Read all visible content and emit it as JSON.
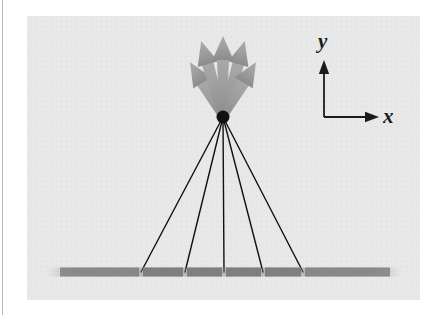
{
  "figure": {
    "kind": "physics-diagram",
    "panel": {
      "background_color": "#e8e8e8",
      "left": 27,
      "top": 16,
      "width": 393,
      "height": 284
    },
    "page_background_color": "#ffffff",
    "left_rule_color": "#b9b9b9"
  },
  "axes": {
    "x_label": "x",
    "y_label": "y",
    "color": "#1a1a1a",
    "origin": {
      "x": 324,
      "y": 117
    },
    "x_tip": {
      "x": 378,
      "y": 117
    },
    "y_tip": {
      "x": 324,
      "y": 62
    }
  },
  "source_point": {
    "label": "point-source",
    "x": 223,
    "y": 117,
    "radius": 6.5,
    "color": "#111111"
  },
  "grating": {
    "label": "diffraction-grating",
    "y": 272,
    "start_x": 46,
    "end_x": 402,
    "thickness": 9,
    "segment_color": "#7f7f7f",
    "segments": [
      {
        "x1": 60,
        "x2": 139
      },
      {
        "x1": 143,
        "x2": 183
      },
      {
        "x1": 187,
        "x2": 222
      },
      {
        "x1": 226,
        "x2": 261
      },
      {
        "x1": 265,
        "x2": 301
      },
      {
        "x1": 305,
        "x2": 390
      }
    ]
  },
  "incident_rays": {
    "label": "incident-rays",
    "color": "#111111",
    "width": 1.4,
    "endpoints_x": [
      141,
      185,
      224,
      263,
      303
    ],
    "endpoint_y": 272
  },
  "diffracted_arrows": {
    "label": "diffracted-arrows",
    "color": "#9a9a9a",
    "count": 5,
    "shaft_width": 7,
    "tips": [
      {
        "x": 192,
        "y": 70
      },
      {
        "x": 207,
        "y": 46
      },
      {
        "x": 224,
        "y": 38
      },
      {
        "x": 241,
        "y": 47
      },
      {
        "x": 255,
        "y": 71
      }
    ]
  }
}
